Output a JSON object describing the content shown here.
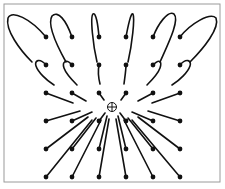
{
  "figure": {
    "kind": "vector-field trajectory diagram",
    "frame": {
      "x": 4,
      "y": 4,
      "width": 216,
      "height": 178,
      "stroke": "#9a9a9a"
    },
    "stroke_color": "#111111",
    "center_marker": {
      "x": 112,
      "y": 107,
      "r": 4.5,
      "icon": "crosshair-circle-icon"
    },
    "grid": {
      "columns": [
        46,
        72,
        99,
        126,
        153,
        180
      ],
      "rows": [
        37,
        65,
        93,
        121,
        149,
        177
      ]
    },
    "paths": [
      {
        "id": "r0c0",
        "d": "M46,37 C30,18 12,10 8,18 C5,30 20,50 32,62"
      },
      {
        "id": "r0c1",
        "d": "M72,37 C66,20 58,10 52,16 C47,24 56,44 66,62"
      },
      {
        "id": "r0c2",
        "d": "M99,37 C98,25 96,12 93,14 C90,17 93,45 97,62"
      },
      {
        "id": "r0c3",
        "d": "M126,37 C128,26 131,12 133,14 C135,18 132,45 128,62"
      },
      {
        "id": "r0c4",
        "d": "M153,37 C158,24 168,10 174,14 C180,20 168,44 160,62"
      },
      {
        "id": "r0c5",
        "d": "M180,37 C190,24 210,12 216,18 C220,28 204,48 190,62"
      },
      {
        "id": "r1c0",
        "d": "M46,65 C40,58 34,60 36,66 C38,72 46,80 54,85"
      },
      {
        "id": "r1c1",
        "d": "M72,65 C66,58 62,62 64,68 C66,74 72,80 77,85"
      },
      {
        "id": "r1c2",
        "d": "M99,65 C98,70 98,76 100,84"
      },
      {
        "id": "r1c3",
        "d": "M126,65 C126,70 125,76 124,84"
      },
      {
        "id": "r1c4",
        "d": "M153,65 C160,58 162,62 160,68 C158,74 152,80 147,85"
      },
      {
        "id": "r1c5",
        "d": "M180,65 C186,58 192,60 190,66 C188,72 180,80 172,85"
      },
      {
        "id": "r2c0",
        "d": "M46,93 L73,103"
      },
      {
        "id": "r2c1",
        "d": "M72,93 L86,101"
      },
      {
        "id": "r2c2",
        "d": "M99,93 L104,100"
      },
      {
        "id": "r2c3",
        "d": "M126,93 L121,100"
      },
      {
        "id": "r2c4",
        "d": "M153,93 L138,101"
      },
      {
        "id": "r2c5",
        "d": "M180,93 L152,103"
      },
      {
        "id": "r3c0",
        "d": "M46,121 L80,111"
      },
      {
        "id": "r3c1",
        "d": "M72,121 L92,112"
      },
      {
        "id": "r3c2",
        "d": "M99,121 L105,113"
      },
      {
        "id": "r3c3",
        "d": "M126,121 L120,113"
      },
      {
        "id": "r3c4",
        "d": "M153,121 L132,112"
      },
      {
        "id": "r3c5",
        "d": "M180,121 L148,111"
      },
      {
        "id": "r4c0",
        "d": "M46,149 L88,117"
      },
      {
        "id": "r4c1",
        "d": "M72,149 L96,118"
      },
      {
        "id": "r4c2",
        "d": "M99,149 L107,116"
      },
      {
        "id": "r4c3",
        "d": "M126,149 L118,116"
      },
      {
        "id": "r4c4",
        "d": "M153,149 L128,118"
      },
      {
        "id": "r4c5",
        "d": "M180,149 L138,117"
      },
      {
        "id": "r5c0",
        "d": "M46,177 L92,120"
      },
      {
        "id": "r5c1",
        "d": "M72,177 L101,120"
      },
      {
        "id": "r5c2",
        "d": "M99,177 L109,119"
      },
      {
        "id": "r5c3",
        "d": "M126,177 L116,119"
      },
      {
        "id": "r5c4",
        "d": "M153,177 L124,120"
      },
      {
        "id": "r5c5",
        "d": "M180,177 L132,120"
      }
    ]
  }
}
